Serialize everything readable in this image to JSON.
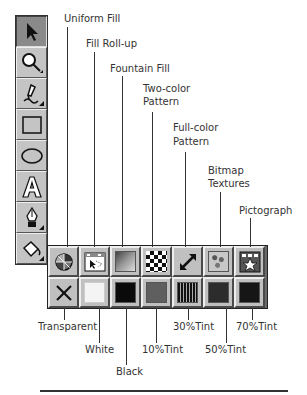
{
  "toolbox": {
    "tools": [
      {
        "name": "pick-tool",
        "icon": "arrow-pointer-icon",
        "active": true
      },
      {
        "name": "zoom-tool",
        "icon": "magnifier-icon",
        "active": false
      },
      {
        "name": "pencil-tool",
        "icon": "pencil-icon",
        "active": false
      },
      {
        "name": "rectangle-tool",
        "icon": "rectangle-icon",
        "active": false
      },
      {
        "name": "ellipse-tool",
        "icon": "ellipse-icon",
        "active": false
      },
      {
        "name": "text-tool",
        "icon": "letter-a-icon",
        "active": false
      },
      {
        "name": "outline-tool",
        "icon": "pen-nib-icon",
        "active": false
      },
      {
        "name": "fill-tool",
        "icon": "paint-bucket-icon",
        "active": false
      }
    ]
  },
  "fill_flyout": {
    "top_row": [
      {
        "label": "Uniform Fill",
        "icon": "color-wheel-icon"
      },
      {
        "label": "Fill Roll-up",
        "icon": "rollup-window-icon"
      },
      {
        "label": "Fountain Fill",
        "icon": "gradient-icon"
      },
      {
        "label": "Two-color Pattern",
        "label_lines": [
          "Two-color",
          "Pattern"
        ],
        "icon": "checkerboard-icon"
      },
      {
        "label": "Full-color Pattern",
        "label_lines": [
          "Full-color",
          "Pattern"
        ],
        "icon": "double-arrow-icon"
      },
      {
        "label": "Bitmap Textures",
        "label_lines": [
          "Bitmap",
          "Textures"
        ],
        "icon": "texture-icon"
      },
      {
        "label": "Pictograph",
        "icon": "pictograph-star-icon"
      }
    ],
    "bottom_row": [
      {
        "label": "Transparent",
        "icon": "x-icon"
      },
      {
        "label": "White",
        "color": "#f4f4f4"
      },
      {
        "label": "Black",
        "color": "#0a0a0a"
      },
      {
        "label": "10%Tint",
        "color": "#b8b8b8"
      },
      {
        "label": "30%Tint",
        "color": "#555555"
      },
      {
        "label": "50%Tint",
        "color": "#2a2a2a"
      },
      {
        "label": "70%Tint",
        "color": "#151515"
      }
    ]
  },
  "labels": {
    "uniform_fill": "Uniform Fill",
    "fill_rollup": "Fill Roll-up",
    "fountain_fill": "Fountain Fill",
    "two_color_1": "Two-color",
    "two_color_2": "Pattern",
    "full_color_1": "Full-color",
    "full_color_2": "Pattern",
    "bitmap_1": "Bitmap",
    "bitmap_2": "Textures",
    "pictograph": "Pictograph",
    "transparent": "Transparent",
    "white": "White",
    "black": "Black",
    "tint10": "10%Tint",
    "tint30": "30%Tint",
    "tint50": "50%Tint",
    "tint70": "70%Tint"
  }
}
